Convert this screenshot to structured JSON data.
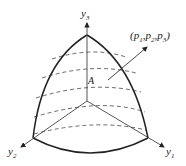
{
  "diagram": {
    "axes": [
      {
        "name": "y3",
        "base": "y",
        "sub": "3"
      },
      {
        "name": "y2",
        "base": "y",
        "sub": "2"
      },
      {
        "name": "y1",
        "base": "y",
        "sub": "1"
      }
    ],
    "region_label": "A",
    "point_label": {
      "open": "(",
      "p": "p",
      "sub1": "1",
      "sub2": "2",
      "sub3": "3",
      "sep": ",",
      "close": ")"
    },
    "colors": {
      "stroke": "#222222",
      "axis": "#444444",
      "dashed": "#444444"
    }
  }
}
